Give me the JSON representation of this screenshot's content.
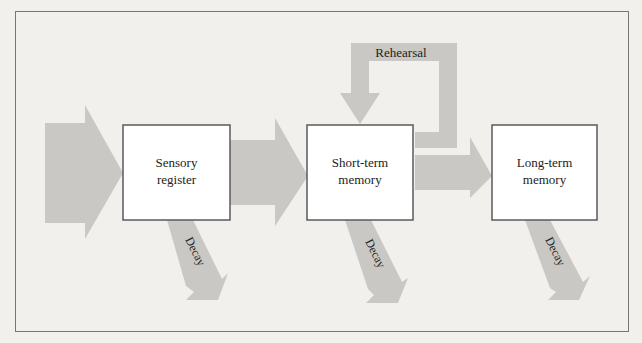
{
  "diagram": {
    "colors": {
      "arrow": "#c9c8c5",
      "box_border": "#5a5a5a",
      "frame": "#777777",
      "background": "#f1f0ed",
      "box_fill": "#ffffff"
    },
    "boxes": [
      {
        "id": "sensory",
        "line1": "Sensory",
        "line2": "register"
      },
      {
        "id": "short",
        "line1": "Short-term",
        "line2": "memory"
      },
      {
        "id": "long",
        "line1": "Long-term",
        "line2": "memory"
      }
    ],
    "rehearsal_label": "Rehearsal",
    "decay_label": "Decay"
  }
}
